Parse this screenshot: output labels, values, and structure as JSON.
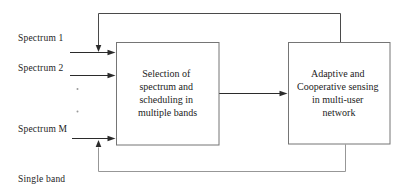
{
  "colors": {
    "background": "#ffffff",
    "box_border": "#757575",
    "arrow_line": "#2b2b2b",
    "top_feedback": "#4a4a4a",
    "bottom_feedback": "#979797",
    "text": "#1c1c1c",
    "dots": "#9a9a9a"
  },
  "inputs": {
    "spectrum_1": "Spectrum 1",
    "spectrum_2": "Spectrum 2",
    "spectrum_m": "Spectrum M",
    "single_band": "Single band"
  },
  "icons": {
    "vertical_ellipsis_icon": "··"
  },
  "boxes": {
    "selection": {
      "lines": [
        "Selection of",
        "spectrum and",
        "scheduling in",
        "multiple bands"
      ]
    },
    "sensing": {
      "lines": [
        "Adaptive and",
        "Cooperative sensing",
        "in multi-user",
        "network"
      ]
    }
  }
}
